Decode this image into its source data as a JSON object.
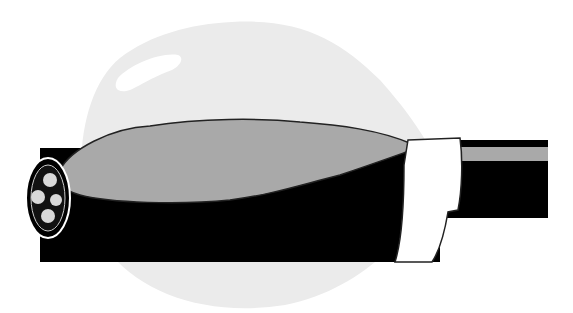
{
  "illustration": {
    "subject": "cable with bulging sheath and tape wrap",
    "colors": {
      "background": "#ffffff",
      "halo": "#ebebeb",
      "bulge": "#a9a9a9",
      "cable": "#000000",
      "tape": "#ffffff",
      "stripe": "#a9a9a9"
    }
  }
}
